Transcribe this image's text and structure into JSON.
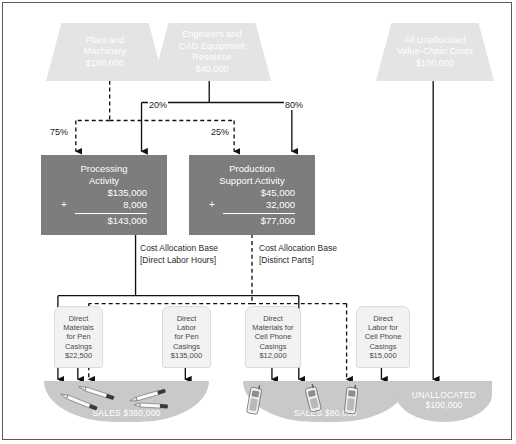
{
  "diagram": {
    "resource_pools": [
      {
        "id": "plant",
        "lines": [
          "Plant and",
          "Machinery",
          "$180,000"
        ]
      },
      {
        "id": "engineers",
        "lines": [
          "Engineers and",
          "CAD Equipment",
          "Resource",
          "$40,000"
        ]
      },
      {
        "id": "unallocated",
        "lines": [
          "All Unallocated",
          "Value-Chain Costs",
          "$100,000"
        ]
      }
    ],
    "allocation_percents": [
      {
        "id": "plant-to-processing",
        "label": "75%"
      },
      {
        "id": "engineers-to-processing",
        "label": "20%"
      },
      {
        "id": "plant-to-support",
        "label": "25%"
      },
      {
        "id": "engineers-to-support",
        "label": "80%"
      }
    ],
    "activities": [
      {
        "id": "processing",
        "name_line1": "Processing",
        "name_line2": "Activity",
        "base_amount": "$135,000",
        "plus_sign": "+",
        "added_amount": "8,000",
        "total_amount": "$143,000"
      },
      {
        "id": "production-support",
        "name_line1": "Production",
        "name_line2": "Support Activity",
        "base_amount": "$45,000",
        "plus_sign": "+",
        "added_amount": "32,000",
        "total_amount": "$77,000"
      }
    ],
    "cost_allocation_bases": [
      {
        "id": "processing-base",
        "title": "Cost Allocation Base",
        "basis": "[Direct Labor Hours]"
      },
      {
        "id": "support-base",
        "title": "Cost Allocation Base",
        "basis": "[Distinct Parts]"
      }
    ],
    "direct_costs": [
      {
        "id": "dm-pen",
        "lines": [
          "Direct",
          "Materials",
          "for Pen",
          "Casings",
          "$22,500"
        ]
      },
      {
        "id": "dl-pen",
        "lines": [
          "Direct",
          "Labor",
          "for Pen",
          "Casings",
          "$135,000"
        ]
      },
      {
        "id": "dm-phone",
        "lines": [
          "Direct",
          "Materials for",
          "Cell Phone",
          "Casings",
          "$12,000"
        ]
      },
      {
        "id": "dl-phone",
        "lines": [
          "Direct",
          "Labor for",
          "Cell Phone",
          "Casings",
          "$15,000"
        ]
      }
    ],
    "outputs": [
      {
        "id": "pen-sales",
        "line1": "SALES $360,000",
        "line2": "",
        "icons": [
          "pen-icon",
          "pen-icon",
          "pen-icon",
          "pen-icon"
        ]
      },
      {
        "id": "phone-sales",
        "line1": "SALES $80,000",
        "line2": "",
        "icons": [
          "cellphone-icon",
          "cellphone-icon",
          "cellphone-icon"
        ]
      },
      {
        "id": "unallocated-sink",
        "line1": "UNALLOCATED",
        "line2": "$100,000",
        "icons": []
      }
    ],
    "colors": {
      "pool_fill": "#e4e4e4",
      "activity_fill": "#7d7d7d",
      "oval_fill": "#c9c9c9",
      "tag_fill": "#f2f2f2",
      "line": "#1a1a1a",
      "frame_border": "#5a5a5a"
    }
  }
}
